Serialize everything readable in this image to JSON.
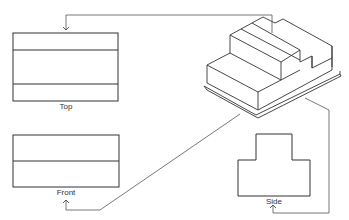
{
  "diagram": {
    "type": "orthographic-projection",
    "colors": {
      "stroke": "#333333",
      "connector": "#555555",
      "background": "#ffffff"
    },
    "views": [
      {
        "id": "top",
        "label": "Top"
      },
      {
        "id": "front",
        "label": "Front"
      },
      {
        "id": "side",
        "label": "Side"
      }
    ],
    "object": "isometric stepped block on base plate",
    "connectors": [
      {
        "from": "isometric-object",
        "to": "top"
      },
      {
        "from": "isometric-object",
        "to": "front"
      },
      {
        "from": "isometric-object",
        "to": "side"
      }
    ]
  }
}
